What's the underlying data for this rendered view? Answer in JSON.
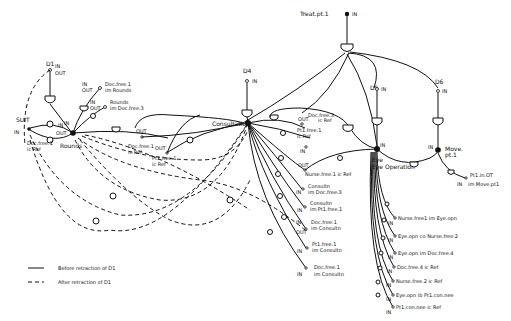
{
  "diagram": {
    "top_node": {
      "label": "Treat.pt.1",
      "port": "IN"
    },
    "resources": [
      {
        "id": "D1",
        "label": "D1",
        "port_in": "IN",
        "port_out": "OUT"
      },
      {
        "id": "D4",
        "label": "D4",
        "port": "IN"
      },
      {
        "id": "D5",
        "label": "D5",
        "port": "IN"
      },
      {
        "id": "D6",
        "label": "D6",
        "port": "IN"
      }
    ],
    "activities": {
      "rounds": "Rounds",
      "consultation": "Consultation",
      "eye_operation": "Eye Operation",
      "move": "Move.pt.1"
    },
    "rounds_labels": [
      {
        "port": "IN",
        "text": "Doc.free.1 im Rounds",
        "out": "OUT"
      },
      {
        "port": "IN",
        "text": "Rounds im Doc.free.3",
        "out": "OUT"
      },
      {
        "port": "OUT",
        "text": "Doc.free.1 ic Ref"
      },
      {
        "port": "OUT",
        "text": "Doc.free.1 ic Ref"
      },
      {
        "port": "OUT",
        "text": "Pt1.free.1 ic Ref"
      },
      {
        "port": "OUT",
        "port2": "IN"
      }
    ],
    "consultation_labels": [
      {
        "text": "Doc.free.3 ic Ref",
        "port": "OUT"
      },
      {
        "text": "Pt1.free.1 ic Ref",
        "port": "IN"
      },
      {
        "text": "Nurse.free.1 ic Ref",
        "port": "OUT"
      },
      {
        "text": "Consultn im Doc.free.3",
        "port": "IN"
      },
      {
        "text": "Consultn im Pt1.free.1",
        "port": "IN"
      },
      {
        "text": "Doc.free.1 im Consultn",
        "port": "IN",
        "out": "OUT"
      },
      {
        "text": "Pt1.free.1 im Consultn",
        "port": "IN"
      },
      {
        "text": "Doc.free.1 im Consultn",
        "port": "IN"
      }
    ],
    "eye_op_labels": [
      {
        "text": "Nurse.free1 im Eye.opn",
        "port": "IN"
      },
      {
        "text": "Eye.opn co Nurse.free.2",
        "port": "IN"
      },
      {
        "text": "Eye.opn im Doc.free.4",
        "port": "IN"
      },
      {
        "text": "Doc.free.4 ic Ref",
        "port": "IN"
      },
      {
        "text": "Nurse.free.2 ic Ref",
        "port": "IN"
      },
      {
        "text": "Eye.opn ib Pt1.con.nee",
        "port": "IN"
      },
      {
        "text": "Pt1.con.nee ic Ref",
        "port": "IN"
      }
    ],
    "move_labels": [
      {
        "text": "Pt1.in.OT",
        "port": "IN"
      },
      {
        "text": "im Move.pt1",
        "port": "IN"
      }
    ],
    "port_labels": {
      "in": "IN",
      "out": "OUT"
    }
  },
  "legend": {
    "solid": "Before retraction of D1",
    "dashed": "After retraction of D1"
  }
}
